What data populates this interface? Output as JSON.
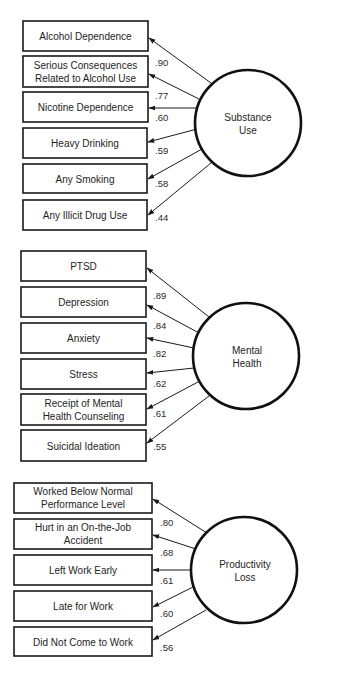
{
  "diagram": {
    "type": "measurement-model",
    "factors": [
      {
        "id": "substance",
        "label_lines": [
          "Substance",
          "Use"
        ],
        "indicators": [
          {
            "label_lines": [
              "Alcohol Dependence"
            ],
            "loading": ".90"
          },
          {
            "label_lines": [
              "Serious Consequences",
              "Related to Alcohol Use"
            ],
            "loading": ".77"
          },
          {
            "label_lines": [
              "Nicotine Dependence"
            ],
            "loading": ".60"
          },
          {
            "label_lines": [
              "Heavy Drinking"
            ],
            "loading": ".59"
          },
          {
            "label_lines": [
              "Any Smoking"
            ],
            "loading": ".58"
          },
          {
            "label_lines": [
              "Any Illicit Drug Use"
            ],
            "loading": ".44"
          }
        ]
      },
      {
        "id": "mental",
        "label_lines": [
          "Mental",
          "Health"
        ],
        "indicators": [
          {
            "label_lines": [
              "PTSD"
            ],
            "loading": ".89"
          },
          {
            "label_lines": [
              "Depression"
            ],
            "loading": ".84"
          },
          {
            "label_lines": [
              "Anxiety"
            ],
            "loading": ".82"
          },
          {
            "label_lines": [
              "Stress"
            ],
            "loading": ".62"
          },
          {
            "label_lines": [
              "Receipt of Mental",
              "Health Counseling"
            ],
            "loading": ".61"
          },
          {
            "label_lines": [
              "Suicidal Ideation"
            ],
            "loading": ".55"
          }
        ]
      },
      {
        "id": "productivity",
        "label_lines": [
          "Productivity",
          "Loss"
        ],
        "indicators": [
          {
            "label_lines": [
              "Worked Below Normal",
              "Performance Level"
            ],
            "loading": ".80"
          },
          {
            "label_lines": [
              "Hurt in an On-the-Job",
              "Accident"
            ],
            "loading": ".68"
          },
          {
            "label_lines": [
              "Left Work Early"
            ],
            "loading": ".61"
          },
          {
            "label_lines": [
              "Late for Work"
            ],
            "loading": ".60"
          },
          {
            "label_lines": [
              "Did Not Come to Work"
            ],
            "loading": ".56"
          }
        ]
      }
    ]
  },
  "colors": {
    "stroke": "#1a1a1a",
    "text": "#1e1e1e",
    "background": "#ffffff"
  }
}
